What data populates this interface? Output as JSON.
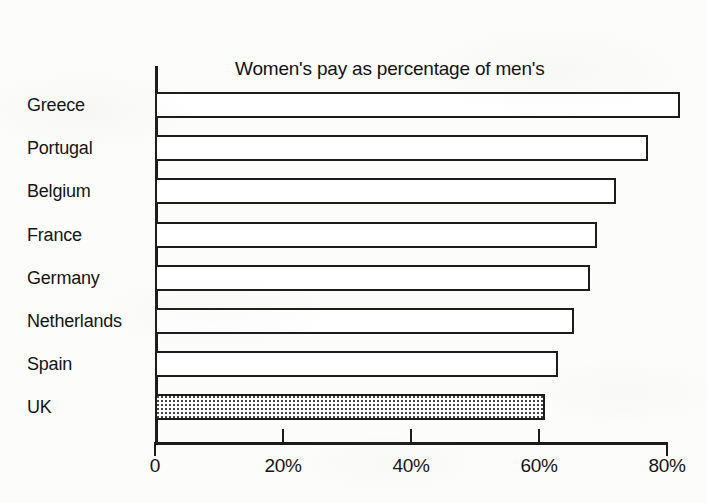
{
  "chart_data": {
    "type": "bar",
    "orientation": "horizontal",
    "title": "Women's pay as percentage of men's\nIn the retail trade",
    "title_lines": [
      "Women's pay as percentage of men's",
      "In the retail trade"
    ],
    "subtitle": "",
    "xlabel": "",
    "ylabel": "",
    "categories": [
      "Greece",
      "Portugal",
      "Belgium",
      "France",
      "Germany",
      "Netherlands",
      "Spain",
      "UK"
    ],
    "values": [
      82,
      77,
      72,
      69,
      68,
      65.5,
      63,
      61
    ],
    "xlim": [
      0,
      80
    ],
    "xticks": [
      0,
      20,
      40,
      60,
      80
    ],
    "xtick_labels": [
      "0",
      "20%",
      "40%",
      "60%",
      "80%"
    ],
    "grid": false,
    "legend": false,
    "bar_styles": [
      "outline",
      "outline",
      "outline",
      "outline",
      "outline",
      "outline",
      "outline",
      "stippled"
    ],
    "highlight_category": "UK",
    "colors": {
      "bar_fill": "#ffffff",
      "bar_outline": "#1c1c1c",
      "highlight_fill_pattern": "#444444",
      "axis": "#1c1c1c",
      "text": "#141414",
      "background": "#fcfcfb"
    }
  }
}
